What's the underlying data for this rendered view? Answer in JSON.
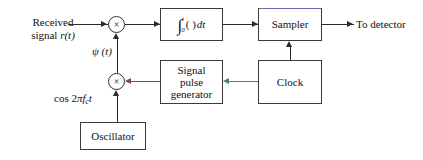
{
  "diagram": {
    "type": "signal-flow-block-diagram",
    "nodes": {
      "input_label_line1": "Received",
      "input_label_line2_prefix": "signal ",
      "input_label_line2_sym": "r(t)",
      "multiplier1_symbol": "×",
      "multiplier2_symbol": "×",
      "integrator_sign": "∫",
      "integrator_upper_limit": "t",
      "integrator_lower_limit": "0",
      "integrator_body": "( )",
      "integrator_dt": "dt",
      "integrator_full": "∫₀ᵗ( ) dt",
      "sampler": "Sampler",
      "output_label": "To detector",
      "signal_pulse_generator_line1": "Signal",
      "signal_pulse_generator_line2": "pulse",
      "signal_pulse_generator_line3": "generator",
      "clock": "Clock",
      "oscillator": "Oscillator",
      "psi_label": "ψ (t)",
      "carrier_label_prefix": "cos 2",
      "carrier_label_pi": "π",
      "carrier_label_f": "f",
      "carrier_label_sub": "c",
      "carrier_label_t": "t",
      "carrier_label_full": "cos 2πfᴄt"
    },
    "colors": {
      "wire": "#2b2b2b",
      "wire_red": "#7b4a52",
      "wire_teal": "#4d7d7d",
      "box_border": "#3a3a3a",
      "accent_blue": "#6a6ab4",
      "background": "#ffffff",
      "text": "#111111"
    },
    "edges": [
      "received signal r(t) -> multiplier 1",
      "multiplier 1 -> integrator",
      "integrator -> sampler",
      "sampler -> to detector",
      "clock -> sampler",
      "clock -> signal pulse generator",
      "signal pulse generator -> multiplier 2",
      "oscillator -> multiplier 2",
      "multiplier 2 -> multiplier 1 (psi(t))"
    ]
  }
}
